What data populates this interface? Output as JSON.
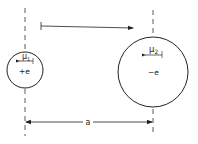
{
  "diagram": {
    "particle_1": {
      "moment_label": "μ",
      "moment_subscript": "1",
      "charge_label": "+e"
    },
    "particle_2": {
      "moment_label": "μ",
      "moment_subscript": "2",
      "charge_label": "−e"
    },
    "separation_label": "a",
    "colors": {
      "stroke": "#222222",
      "background": "#ffffff"
    }
  }
}
